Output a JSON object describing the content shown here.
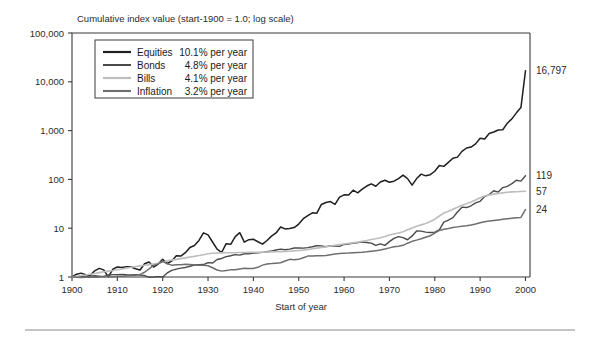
{
  "chart_data": {
    "type": "line",
    "title": "Cumulative index value (start-1900 = 1.0; log scale)",
    "xlabel": "Start of year",
    "ylabel": "",
    "scale": "log",
    "grid": false,
    "legend_position": "top-left",
    "xlim": [
      1900,
      2001
    ],
    "ylim": [
      1,
      100000
    ],
    "x_ticks": [
      1900,
      1910,
      1920,
      1930,
      1940,
      1950,
      1960,
      1970,
      1980,
      1990,
      2000
    ],
    "x_tick_labels": [
      "1900",
      "1910",
      "1920",
      "1930",
      "1940",
      "1950",
      "1960",
      "1970",
      "1980",
      "1990",
      "2000"
    ],
    "y_ticks": [
      1,
      10,
      100,
      1000,
      10000,
      100000
    ],
    "y_tick_labels": [
      "1",
      "10",
      "100",
      "1,000",
      "10,000",
      "100,000"
    ],
    "x": [
      1900,
      1901,
      1902,
      1903,
      1904,
      1905,
      1906,
      1907,
      1908,
      1909,
      1910,
      1911,
      1912,
      1913,
      1914,
      1915,
      1916,
      1917,
      1918,
      1919,
      1920,
      1921,
      1922,
      1923,
      1924,
      1925,
      1926,
      1927,
      1928,
      1929,
      1930,
      1931,
      1932,
      1933,
      1934,
      1935,
      1936,
      1937,
      1938,
      1939,
      1940,
      1941,
      1942,
      1943,
      1944,
      1945,
      1946,
      1947,
      1948,
      1949,
      1950,
      1951,
      1952,
      1953,
      1954,
      1955,
      1956,
      1957,
      1958,
      1959,
      1960,
      1961,
      1962,
      1963,
      1964,
      1965,
      1966,
      1967,
      1968,
      1969,
      1970,
      1971,
      1972,
      1973,
      1974,
      1975,
      1976,
      1977,
      1978,
      1979,
      1980,
      1981,
      1982,
      1983,
      1984,
      1985,
      1986,
      1987,
      1988,
      1989,
      1990,
      1991,
      1992,
      1993,
      1994,
      1995,
      1996,
      1997,
      1998,
      1999,
      2000
    ],
    "series": [
      {
        "name": "Equities",
        "annual_return_label": "10.1% per year",
        "color": "#1f1f1f",
        "width": 1.5,
        "end_value": 16797,
        "end_label": "16,797",
        "values": [
          1.0,
          1.14,
          1.2,
          1.11,
          1.07,
          1.34,
          1.5,
          1.4,
          1.01,
          1.44,
          1.61,
          1.56,
          1.63,
          1.62,
          1.48,
          1.39,
          1.87,
          2.03,
          1.6,
          1.84,
          2.31,
          1.89,
          2.13,
          2.73,
          2.68,
          3.15,
          4.03,
          4.42,
          5.62,
          8.02,
          7.28,
          5.21,
          3.72,
          3.18,
          4.82,
          4.68,
          6.71,
          8.1,
          5.18,
          5.82,
          5.94,
          5.28,
          4.71,
          5.6,
          6.87,
          7.98,
          10.6,
          9.66,
          9.84,
          10.32,
          12.16,
          15.65,
          18.13,
          20.67,
          20.3,
          30.65,
          33.67,
          35.12,
          30.75,
          43.41,
          48.21,
          47.88,
          60.03,
          52.98,
          63.22,
          73.13,
          81.0,
          72.52,
          88.22,
          95.84,
          87.45,
          91.85,
          104.1,
          122.4,
          104.0,
          76.2,
          104.0,
          128.1,
          118.3,
          125.0,
          147.0,
          192.5,
          184.9,
          223.0,
          271.0,
          286.0,
          375.0,
          440.0,
          460.0,
          534.0,
          698.0,
          673.0,
          873.0,
          938.0,
          1028.0,
          1040.0,
          1420.0,
          1740.0,
          2310.0,
          2960.0,
          16797.0
        ]
      },
      {
        "name": "Bonds",
        "annual_return_label": "4.8% per year",
        "color": "#4a4a4a",
        "width": 1.4,
        "end_value": 119,
        "end_label": "119",
        "values": [
          1.0,
          1.01,
          1.03,
          1.0,
          1.04,
          1.06,
          1.04,
          1.02,
          1.1,
          1.12,
          1.12,
          1.13,
          1.11,
          1.1,
          1.12,
          1.09,
          1.07,
          0.99,
          1.0,
          1.02,
          1.0,
          1.21,
          1.37,
          1.45,
          1.52,
          1.57,
          1.66,
          1.76,
          1.79,
          1.8,
          1.97,
          1.94,
          2.28,
          2.4,
          2.62,
          2.73,
          2.87,
          2.81,
          3.0,
          2.99,
          3.08,
          3.12,
          3.2,
          3.3,
          3.4,
          3.58,
          3.72,
          3.62,
          3.73,
          3.92,
          3.96,
          3.9,
          4.0,
          4.16,
          4.38,
          4.35,
          4.2,
          4.38,
          4.32,
          4.25,
          4.65,
          4.72,
          4.98,
          5.05,
          5.2,
          5.1,
          4.95,
          4.45,
          4.78,
          4.45,
          5.3,
          6.2,
          6.7,
          6.4,
          5.8,
          6.95,
          8.8,
          8.7,
          8.3,
          8.15,
          8.3,
          9.2,
          13.3,
          14.6,
          16.5,
          21.5,
          27.0,
          26.5,
          28.8,
          33.0,
          35.5,
          44.5,
          49.0,
          58.5,
          55.0,
          68.0,
          72.0,
          82.0,
          96.0,
          92.0,
          119.0
        ]
      },
      {
        "name": "Bills",
        "annual_return_label": "4.1% per year",
        "color": "#bdbdbd",
        "width": 1.6,
        "end_value": 57,
        "end_label": "57",
        "values": [
          1.0,
          1.03,
          1.07,
          1.1,
          1.14,
          1.18,
          1.23,
          1.28,
          1.32,
          1.36,
          1.41,
          1.46,
          1.52,
          1.58,
          1.64,
          1.69,
          1.74,
          1.79,
          1.85,
          1.92,
          2.02,
          2.14,
          2.22,
          2.3,
          2.38,
          2.47,
          2.56,
          2.65,
          2.75,
          2.87,
          3.0,
          3.07,
          3.1,
          3.12,
          3.13,
          3.14,
          3.15,
          3.17,
          3.18,
          3.19,
          3.21,
          3.22,
          3.23,
          3.25,
          3.27,
          3.29,
          3.31,
          3.34,
          3.38,
          3.43,
          3.49,
          3.56,
          3.66,
          3.78,
          3.91,
          4.02,
          4.15,
          4.32,
          4.47,
          4.6,
          4.73,
          4.88,
          5.02,
          5.18,
          5.37,
          5.58,
          5.85,
          6.1,
          6.4,
          6.78,
          7.25,
          7.6,
          7.95,
          8.5,
          9.3,
          10.1,
          11.0,
          11.7,
          12.5,
          13.7,
          15.3,
          17.8,
          20.5,
          22.2,
          24.5,
          27.0,
          29.4,
          31.7,
          34.5,
          38.0,
          42.0,
          45.5,
          48.0,
          50.0,
          51.5,
          53.0,
          54.5,
          55.5,
          56.0,
          56.5,
          57.0
        ]
      },
      {
        "name": "Inflation",
        "annual_return_label": "3.2% per year",
        "color": "#6e6e6e",
        "width": 1.5,
        "end_value": 24,
        "end_label": "24",
        "values": [
          1.0,
          0.99,
          0.98,
          0.99,
          1.0,
          0.99,
          1.0,
          1.03,
          1.02,
          1.01,
          1.03,
          1.04,
          1.06,
          1.07,
          1.08,
          1.12,
          1.25,
          1.47,
          1.73,
          1.86,
          2.09,
          1.87,
          1.75,
          1.78,
          1.79,
          1.83,
          1.8,
          1.77,
          1.74,
          1.74,
          1.7,
          1.55,
          1.39,
          1.32,
          1.36,
          1.4,
          1.41,
          1.46,
          1.51,
          1.49,
          1.5,
          1.58,
          1.75,
          1.85,
          1.88,
          1.92,
          1.96,
          2.13,
          2.3,
          2.27,
          2.3,
          2.48,
          2.68,
          2.7,
          2.72,
          2.73,
          2.77,
          2.86,
          2.95,
          3.03,
          3.06,
          3.09,
          3.14,
          3.18,
          3.22,
          3.28,
          3.37,
          3.46,
          3.57,
          3.74,
          3.95,
          4.16,
          4.29,
          4.45,
          4.93,
          5.38,
          5.7,
          6.06,
          6.51,
          7.0,
          7.95,
          9.0,
          9.55,
          9.86,
          10.3,
          10.65,
          11.0,
          11.2,
          11.65,
          12.2,
          12.9,
          13.6,
          14.0,
          14.45,
          14.8,
          15.2,
          15.65,
          16.0,
          16.3,
          16.6,
          24.0
        ]
      }
    ]
  },
  "legend": {
    "rows": [
      {
        "name": "Equities",
        "rate": "10.1% per year"
      },
      {
        "name": "Bonds",
        "rate": "4.8% per year"
      },
      {
        "name": "Bills",
        "rate": "4.1% per year"
      },
      {
        "name": "Inflation",
        "rate": "3.2% per year"
      }
    ]
  },
  "end_labels": [
    {
      "text": "16,797",
      "series": "Equities"
    },
    {
      "text": "119",
      "series": "Bonds"
    },
    {
      "text": "57",
      "series": "Bills"
    },
    {
      "text": "24",
      "series": "Inflation"
    }
  ]
}
